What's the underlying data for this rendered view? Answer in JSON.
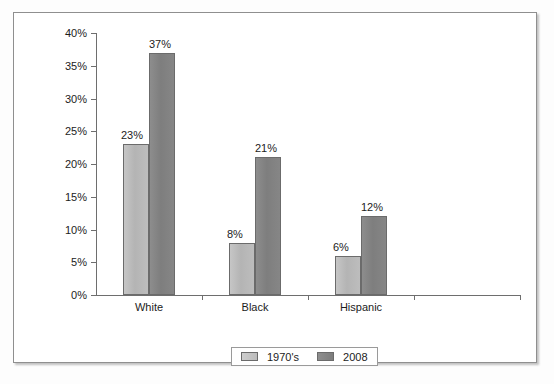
{
  "chart_data": {
    "type": "bar",
    "title": "",
    "xlabel": "",
    "ylabel": "",
    "categories": [
      "White",
      "Black",
      "Hispanic",
      ""
    ],
    "series": [
      {
        "name": "1970's",
        "values": [
          23,
          8,
          6,
          null
        ],
        "color": "#bdbdbd"
      },
      {
        "name": "2008",
        "values": [
          37,
          21,
          12,
          null
        ],
        "color": "#808080"
      }
    ],
    "data_labels": [
      [
        "23%",
        "37%"
      ],
      [
        "8%",
        "21%"
      ],
      [
        "6%",
        "12%"
      ],
      [
        "",
        ""
      ]
    ],
    "ylim": [
      0,
      40
    ],
    "ytick_values": [
      0,
      5,
      10,
      15,
      20,
      25,
      30,
      35,
      40
    ],
    "ytick_labels": [
      "0%",
      "5%",
      "10%",
      "15%",
      "20%",
      "25%",
      "30%",
      "35%",
      "40%"
    ],
    "grid": false,
    "legend_position": "bottom-center",
    "legend_entries": [
      "1970's",
      "2008"
    ]
  },
  "frame": {
    "border_color": "#8f8f8f",
    "background": "#ffffff"
  },
  "axis": {
    "line_color": "#6e6e6e"
  }
}
